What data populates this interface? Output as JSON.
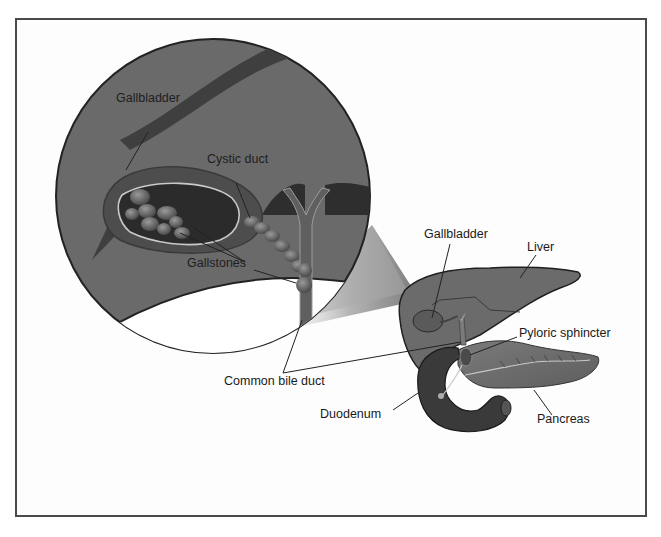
{
  "diagram": {
    "type": "anatomical-illustration",
    "colors": {
      "frame": "#4a4a4a",
      "tissue_dark": "#5a5a5a",
      "tissue_mid": "#6e6e6e",
      "organ_fill": "#6b6b6b",
      "duct_highlight": "#bdbdbd",
      "background": "#ffffff"
    },
    "inset": {
      "shape": "circle",
      "labels": {
        "gallbladder": "Gallbladder",
        "cystic_duct": "Cystic duct",
        "gallstones": "Gallstones"
      }
    },
    "overview": {
      "labels": {
        "gallbladder": "Gallbladder",
        "liver": "Liver",
        "pyloric_sphincter": "Pyloric sphincter",
        "pancreas": "Pancreas",
        "duodenum": "Duodenum"
      }
    },
    "shared_labels": {
      "common_bile_duct": "Common bile duct"
    }
  }
}
